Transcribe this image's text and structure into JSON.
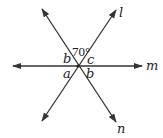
{
  "diagram": {
    "type": "intersecting-lines",
    "intersection": {
      "x": 78,
      "y": 66
    },
    "lines": [
      {
        "name": "l",
        "label": "l",
        "from": {
          "x": 42,
          "y": 121
        },
        "to": {
          "x": 116,
          "y": 10
        },
        "label_pos": {
          "x": 119,
          "y": 17
        }
      },
      {
        "name": "m",
        "label": "m",
        "from": {
          "x": 13,
          "y": 66
        },
        "to": {
          "x": 142,
          "y": 66
        },
        "label_pos": {
          "x": 146,
          "y": 70
        }
      },
      {
        "name": "n",
        "label": "n",
        "from": {
          "x": 42,
          "y": 9
        },
        "to": {
          "x": 116,
          "y": 122
        },
        "label_pos": {
          "x": 117,
          "y": 133
        }
      }
    ],
    "angles": [
      {
        "name": "angle-top",
        "label": "70°",
        "pos": {
          "x": 72,
          "y": 56
        }
      },
      {
        "name": "angle-b-upper-left",
        "label": "b",
        "pos": {
          "x": 63,
          "y": 63
        }
      },
      {
        "name": "angle-c-upper-right",
        "label": "c",
        "pos": {
          "x": 87,
          "y": 64
        }
      },
      {
        "name": "angle-a-lower-left",
        "label": "a",
        "pos": {
          "x": 63,
          "y": 78
        }
      },
      {
        "name": "angle-b-lower-right",
        "label": "b",
        "pos": {
          "x": 86,
          "y": 78
        }
      }
    ],
    "colors": {
      "line": "#333333",
      "text": "#222222",
      "background": "#ffffff"
    }
  }
}
